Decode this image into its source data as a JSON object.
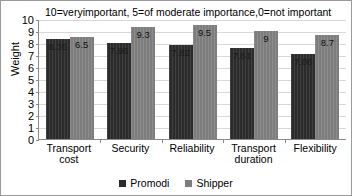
{
  "chart_data": {
    "type": "bar",
    "title": "10=veryimportant, 5=of moderate importance,0=not important",
    "xlabel": "",
    "ylabel": "Weight",
    "ylim": [
      0,
      10
    ],
    "yticks": [
      0,
      1,
      2,
      3,
      4,
      5,
      6,
      7,
      8,
      9,
      10
    ],
    "grid": true,
    "legend_position": "bottom",
    "categories": [
      "Transport cost",
      "Security",
      "Reliability",
      "Transport duration",
      "Flexibility"
    ],
    "series": [
      {
        "name": "Promodi",
        "color": "#2b2b2b",
        "values": [
          8.35,
          7.96,
          7.82,
          7.61,
          7.06
        ],
        "labels": [
          "8.35",
          "7.96",
          "7.82",
          "7.61",
          "7.06"
        ]
      },
      {
        "name": "Shipper",
        "color": "#7d7d7d",
        "values": [
          8.5,
          9.3,
          9.5,
          9.0,
          8.7
        ],
        "labels": [
          "6.5",
          "9.3",
          "9.5",
          "9",
          "8.7"
        ]
      }
    ]
  },
  "legend": {
    "items": [
      {
        "label": "Promodi",
        "color": "#2b2b2b"
      },
      {
        "label": "Shipper",
        "color": "#7d7d7d"
      }
    ]
  }
}
